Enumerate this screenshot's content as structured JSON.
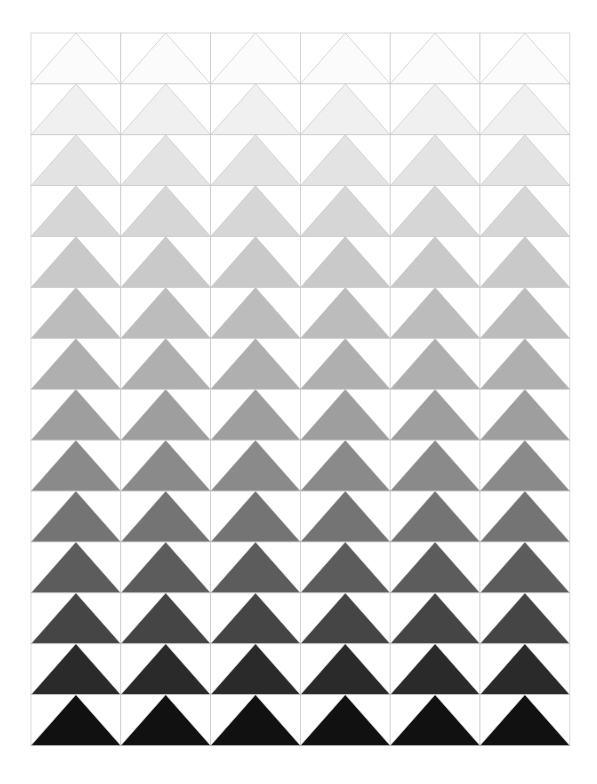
{
  "canvas": {
    "width": 597,
    "height": 784,
    "background": "#ffffff"
  },
  "artwork": {
    "title": "Grayscale Triangle Gradient Grid",
    "description": "A 6-column by 14-row grid of square cells; each cell holds an isoceles triangle whose apex sits at the top-center of the cell and whose base spans the full bottom edge. Triangle fill darkens monotonically from near-white in the top row to black in the bottom row.",
    "shape": "triangle-apex-top",
    "grid": {
      "columns": 6,
      "rows": 14,
      "origin_x": 31,
      "origin_y": 33,
      "cell_width": 89.8,
      "cell_height": 50.9,
      "total_width": 539,
      "total_height": 713
    },
    "stroke": {
      "color": "#c8c8c8",
      "width": 0.7
    },
    "row_fills": [
      "#fbfbfb",
      "#f0f0f0",
      "#e3e3e3",
      "#d6d6d6",
      "#c9c9c9",
      "#bcbcbc",
      "#afafaf",
      "#9e9e9e",
      "#8a8a8a",
      "#747474",
      "#5c5c5c",
      "#454545",
      "#2a2a2a",
      "#111111"
    ],
    "row_values": [
      251,
      240,
      227,
      214,
      201,
      188,
      175,
      158,
      138,
      116,
      92,
      69,
      42,
      17
    ]
  }
}
